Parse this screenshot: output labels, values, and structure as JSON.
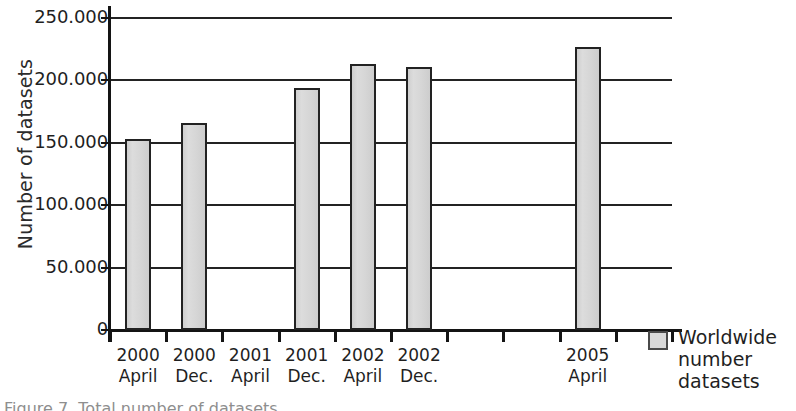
{
  "chart_data": {
    "type": "bar",
    "title": "",
    "xlabel": "",
    "ylabel": "Number of datasets",
    "categories": [
      "2000 April",
      "2000 Dec.",
      "2001 April",
      "2001 Dec.",
      "2002 April",
      "2002 Dec.",
      "",
      "",
      "2005 April",
      ""
    ],
    "category_lines": [
      [
        "2000",
        "April"
      ],
      [
        "2000",
        "Dec."
      ],
      [
        "2001",
        "April"
      ],
      [
        "2001",
        "Dec."
      ],
      [
        "2002",
        "April"
      ],
      [
        "2002",
        "Dec."
      ],
      [
        "",
        ""
      ],
      [
        "",
        ""
      ],
      [
        "2005",
        "April"
      ],
      [
        "",
        ""
      ]
    ],
    "values": [
      153000,
      166000,
      null,
      194000,
      213000,
      211000,
      null,
      null,
      227000,
      null
    ],
    "series": [
      {
        "name": "Worldwide number datasets",
        "values": [
          153000,
          166000,
          null,
          194000,
          213000,
          211000,
          null,
          null,
          227000,
          null
        ]
      }
    ],
    "ylim": [
      0,
      250000
    ],
    "ytick_values": [
      0,
      50000,
      100000,
      150000,
      200000,
      250000
    ],
    "ytick_labels": [
      "0",
      "50.000",
      "100.000",
      "150.000",
      "200.000",
      "250.000"
    ],
    "grid": "horizontal",
    "legend_position": "right",
    "bar_fill_color": "#d9d9d9",
    "bar_border_color": "#222222",
    "axis_color": "#141414",
    "background_color": "#ffffff"
  },
  "legend": {
    "entries": [
      {
        "label_lines": [
          "Worldwide",
          "number",
          "datasets"
        ],
        "label": "Worldwide number datasets",
        "swatch_color": "#d9d9d9"
      }
    ]
  },
  "caption": {
    "text": "Figure 7. Total number of datasets"
  }
}
